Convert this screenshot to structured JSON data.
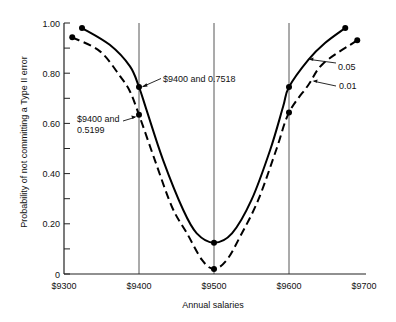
{
  "chart_data": {
    "type": "line",
    "title": "",
    "xlabel": "Annual salaries",
    "ylabel": "Probability of not committing a Type II error",
    "xlim": [
      9300,
      9700
    ],
    "ylim": [
      0,
      1.0
    ],
    "x_ticks": [
      {
        "value": 9300,
        "label": "$9300"
      },
      {
        "value": 9400,
        "label": "$9400"
      },
      {
        "value": 9500,
        "label": "$9500"
      },
      {
        "value": 9600,
        "label": "$9600"
      },
      {
        "value": 9700,
        "label": "$9700"
      }
    ],
    "y_ticks": [
      {
        "value": 0,
        "label": "0"
      },
      {
        "value": 0.2,
        "label": "0.20"
      },
      {
        "value": 0.4,
        "label": "0.40"
      },
      {
        "value": 0.6,
        "label": "0.60"
      },
      {
        "value": 0.8,
        "label": "0.80"
      },
      {
        "value": 1.0,
        "label": "1.00"
      }
    ],
    "y_minor_ticks": [
      0.1,
      0.3,
      0.5,
      0.7,
      0.9
    ],
    "reference_lines_x": [
      9400,
      9500,
      9600
    ],
    "grid": false,
    "legend_position": "inline-annotations",
    "series": [
      {
        "name": "0.05",
        "style": "solid",
        "points": [
          [
            9324,
            0.98
          ],
          [
            9361,
            0.913
          ],
          [
            9388,
            0.827
          ],
          [
            9400,
            0.745
          ],
          [
            9410,
            0.654
          ],
          [
            9432,
            0.455
          ],
          [
            9459,
            0.255
          ],
          [
            9477,
            0.162
          ],
          [
            9500,
            0.125
          ],
          [
            9524,
            0.162
          ],
          [
            9550,
            0.295
          ],
          [
            9575,
            0.495
          ],
          [
            9592,
            0.665
          ],
          [
            9600,
            0.745
          ],
          [
            9626,
            0.854
          ],
          [
            9648,
            0.92
          ],
          [
            9675,
            0.98
          ]
        ],
        "markers": [
          [
            9324,
            0.98
          ],
          [
            9400,
            0.745
          ],
          [
            9500,
            0.125
          ],
          [
            9600,
            0.745
          ],
          [
            9675,
            0.98
          ]
        ]
      },
      {
        "name": "0.01",
        "style": "dashed",
        "points": [
          [
            9311,
            0.943
          ],
          [
            9348,
            0.887
          ],
          [
            9375,
            0.787
          ],
          [
            9388,
            0.727
          ],
          [
            9400,
            0.634
          ],
          [
            9421,
            0.455
          ],
          [
            9444,
            0.267
          ],
          [
            9464,
            0.162
          ],
          [
            9484,
            0.056
          ],
          [
            9500,
            0.02
          ],
          [
            9517,
            0.056
          ],
          [
            9535,
            0.15
          ],
          [
            9559,
            0.295
          ],
          [
            9583,
            0.495
          ],
          [
            9600,
            0.643
          ],
          [
            9626,
            0.754
          ],
          [
            9646,
            0.84
          ],
          [
            9691,
            0.931
          ]
        ],
        "markers": [
          [
            9311,
            0.943
          ],
          [
            9400,
            0.634
          ],
          [
            9500,
            0.02
          ],
          [
            9600,
            0.643
          ],
          [
            9691,
            0.931
          ]
        ]
      }
    ],
    "annotations": [
      {
        "id": "solid_9400",
        "lines": [
          "$9400 and 0.7518"
        ],
        "points_to": [
          9400,
          0.7518
        ]
      },
      {
        "id": "dashed_9400",
        "lines": [
          "$9400 and",
          "0.5199"
        ],
        "points_to": [
          9400,
          0.5199
        ]
      },
      {
        "id": "label_005",
        "lines": [
          "0.05"
        ],
        "points_to_series": "0.05"
      },
      {
        "id": "label_001",
        "lines": [
          "0.01"
        ],
        "points_to_series": "0.01"
      }
    ]
  }
}
